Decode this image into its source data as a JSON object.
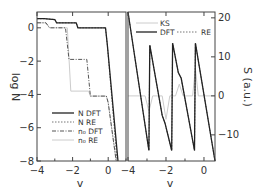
{
  "chart_data": [
    {
      "type": "line",
      "panel": "left",
      "title": "",
      "xlabel": "v",
      "ylabel": "log N",
      "xlim": [
        -4,
        1.0
      ],
      "ylim": [
        -8,
        0.95
      ],
      "xticks": [
        -4,
        -2,
        0
      ],
      "yticks": [
        0,
        -2,
        -4,
        -6,
        -8
      ],
      "grid": false,
      "legend_position": "lower-left",
      "series": [
        {
          "name": "N DFT",
          "style": "solid",
          "color": "#222222",
          "x": [
            -4.0,
            -3.6,
            -3.0,
            -2.9,
            -1.8,
            -1.7,
            -0.15,
            -0.05,
            0.55
          ],
          "y": [
            0.55,
            0.55,
            0.5,
            0.3,
            0.3,
            0.0,
            0.0,
            -1.0,
            -8.0
          ]
        },
        {
          "name": "N RE",
          "style": "dotted",
          "color": "#666666",
          "x": [
            -4.0,
            -3.6,
            -3.0,
            -2.9,
            -1.8,
            -1.7,
            -0.15,
            -0.05,
            0.5
          ],
          "y": [
            0.55,
            0.55,
            0.5,
            0.3,
            0.3,
            0.0,
            0.0,
            -1.0,
            -8.0
          ]
        },
        {
          "name": "n0 DFT",
          "style": "dashdot",
          "color": "#555555",
          "x": [
            -4.0,
            -3.5,
            -3.3,
            -2.4,
            -2.2,
            -1.2,
            -1.0,
            -0.1,
            0.0,
            0.45
          ],
          "y": [
            0.3,
            0.3,
            0.0,
            0.0,
            -1.9,
            -1.9,
            -4.1,
            -4.1,
            -4.5,
            -8.0
          ]
        },
        {
          "name": "n0 RE",
          "style": "solid-faint",
          "color": "#cccccc",
          "x": [
            -4.0,
            -3.5,
            -3.3,
            -2.3,
            -2.1,
            -1.1,
            -1.0,
            -0.1,
            0.0,
            0.45
          ],
          "y": [
            0.3,
            0.3,
            0.0,
            0.0,
            -3.8,
            -3.8,
            -4.1,
            -4.1,
            -4.5,
            -8.0
          ]
        }
      ]
    },
    {
      "type": "line",
      "panel": "right",
      "title": "",
      "xlabel": "v",
      "ylabel": "S (a.u.)",
      "xlim": [
        -4,
        0.58
      ],
      "ylim": [
        -16.7,
        21.5
      ],
      "xticks": [
        -4,
        -2,
        0
      ],
      "yticks": [
        20,
        10,
        0,
        -10
      ],
      "grid": false,
      "legend_position": "top",
      "series": [
        {
          "name": "KS",
          "style": "solid-faint",
          "color": "#cccccc",
          "x": [
            -4.0,
            -3.1,
            -2.9,
            -2.7,
            -2.2,
            -2.0,
            -1.8,
            -1.5,
            -1.3,
            -1.1,
            -0.6,
            -0.45,
            -0.3,
            0.58
          ],
          "y": [
            0,
            0,
            -4,
            0,
            0,
            -6,
            0,
            0,
            3,
            0,
            0,
            7,
            0,
            0
          ]
        },
        {
          "name": "DFT",
          "style": "solid",
          "color": "#222222",
          "x": [
            -4.0,
            -2.9,
            -2.85,
            -2.2,
            -2.05,
            -1.7,
            -1.65,
            -1.35,
            -1.2,
            -0.5,
            -0.45,
            0.58
          ],
          "y": [
            21.5,
            -14,
            13,
            -5,
            -7,
            -14,
            13.5,
            6,
            4.5,
            -14,
            13.5,
            -16.7
          ]
        },
        {
          "name": "RE",
          "style": "dotted",
          "color": "#666666",
          "x": [
            -4.0,
            -2.9,
            -2.85,
            -2.2,
            -2.05,
            -1.7,
            -1.65,
            -1.35,
            -1.2,
            -0.5,
            -0.45,
            0.58
          ],
          "y": [
            21.5,
            -14,
            13,
            -5,
            -7,
            -14,
            13.5,
            6,
            4.5,
            -14,
            13.5,
            -16.7
          ]
        }
      ]
    }
  ],
  "left": {
    "ylabel": "log N",
    "xlabel": "v",
    "xtick_labels": [
      "-4",
      "-2",
      "0"
    ],
    "ytick_labels": [
      "0",
      "-2",
      "-4",
      "-6",
      "-8"
    ],
    "legend": [
      "N DFT",
      "N RE",
      "n₀ DFT",
      "n₀ RE"
    ]
  },
  "right": {
    "ylabel": "S (a.u.)",
    "xlabel": "v",
    "xtick_labels": [
      "-4",
      "-2",
      "0"
    ],
    "ytick_labels": [
      "20",
      "10",
      "0",
      "-10"
    ],
    "legend": [
      "KS",
      "DFT",
      "RE"
    ]
  }
}
